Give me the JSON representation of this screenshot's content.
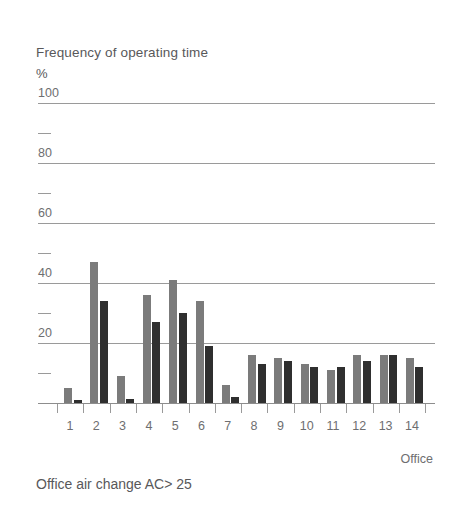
{
  "chart": {
    "axis_title": "Frequency of operating time",
    "axis_unit": "%",
    "caption": "Office air change AC> 25",
    "xaxis_title": "Office"
  },
  "chart_data": {
    "type": "bar",
    "title": "Frequency of operating time",
    "subtitle": "Office air change AC> 25",
    "xlabel": "Office",
    "ylabel": "Frequency of operating time",
    "yunit": "%",
    "ylim": [
      0,
      100
    ],
    "grid": true,
    "legend": "none",
    "ytick_labels": [
      "100",
      "80",
      "60",
      "40",
      "20"
    ],
    "ytick_values": [
      100,
      80,
      60,
      40,
      20
    ],
    "yminor_values": [
      90,
      70,
      50,
      30,
      10
    ],
    "categories": [
      "1",
      "2",
      "3",
      "4",
      "5",
      "6",
      "7",
      "8",
      "9",
      "10",
      "11",
      "12",
      "13",
      "14"
    ],
    "series": [
      {
        "name": "series-light",
        "color": "#7b7b7b",
        "values": [
          5,
          47,
          9,
          36,
          41,
          34,
          6,
          16,
          15,
          13,
          11,
          16,
          16,
          15
        ]
      },
      {
        "name": "series-dark",
        "color": "#2f2f2f",
        "values": [
          1,
          34,
          1.5,
          27,
          30,
          19,
          2,
          13,
          14,
          12,
          12,
          14,
          16,
          12
        ]
      }
    ]
  },
  "colors": {
    "light_bar": "#7b7b7b",
    "dark_bar": "#2f2f2f",
    "gridline": "#9a9a9a",
    "text": "#58585a"
  }
}
